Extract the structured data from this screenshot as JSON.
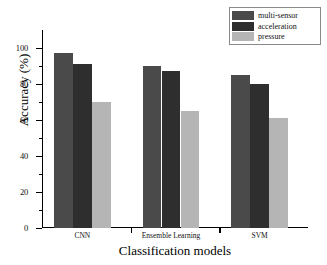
{
  "chart_data": {
    "type": "bar",
    "title": "",
    "xlabel": "Classification models",
    "ylabel": "Accuracy (%)",
    "categories": [
      "CNN",
      "Ensemble Learning",
      "SVM"
    ],
    "series": [
      {
        "name": "multi-sensor",
        "color": "#4a4a4a",
        "values": [
          97,
          90,
          85
        ]
      },
      {
        "name": "acceleration",
        "color": "#2e2e2e",
        "values": [
          91,
          87,
          80
        ]
      },
      {
        "name": "pressure",
        "color": "#b5b5b5",
        "values": [
          70,
          65,
          61
        ]
      }
    ],
    "ylim": [
      0,
      110
    ],
    "y_ticks_major": [
      0,
      20,
      40,
      60,
      80,
      100
    ],
    "y_tick_labels": [
      "0",
      "20",
      "40",
      "60",
      "80",
      "100"
    ],
    "y_ticks_minor": [
      10,
      30,
      50,
      70,
      90
    ],
    "grid": false,
    "legend_position": "top-right"
  },
  "axes": {
    "y_title": "Accuracy (%)",
    "x_title": "Classification models"
  },
  "legend": {
    "entries": [
      {
        "label": "multi-sensor",
        "color": "#4a4a4a"
      },
      {
        "label": "acceleration",
        "color": "#2e2e2e"
      },
      {
        "label": "pressure",
        "color": "#b5b5b5"
      }
    ]
  }
}
